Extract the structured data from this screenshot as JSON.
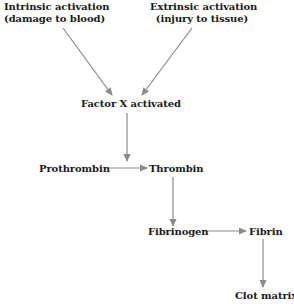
{
  "diagram": {
    "title": "",
    "nodes": {
      "intrinsic": {
        "line1": "Intrinsic activation",
        "line2": "(damage to blood)"
      },
      "extrinsic": {
        "line1": "Extrinsic activation",
        "line2": "(injury to tissue)"
      },
      "factor_x": {
        "label": "Factor X activated"
      },
      "prothrombin": {
        "label": "Prothrombin"
      },
      "thrombin": {
        "label": "Thrombin"
      },
      "fibrinogen": {
        "label": "Fibrinogen"
      },
      "fibrin": {
        "label": "Fibrin"
      },
      "clot_matrix": {
        "label": "Clot matrix"
      }
    },
    "edges": [
      {
        "from": "intrinsic",
        "to": "factor_x"
      },
      {
        "from": "extrinsic",
        "to": "factor_x"
      },
      {
        "from": "factor_x",
        "to": "thrombin"
      },
      {
        "from": "prothrombin",
        "to": "thrombin"
      },
      {
        "from": "thrombin",
        "to": "fibrinogen"
      },
      {
        "from": "fibrinogen",
        "to": "fibrin"
      },
      {
        "from": "fibrin",
        "to": "clot_matrix"
      }
    ],
    "colors": {
      "arrow": "#8a8a8a",
      "text": "#1a1a1a",
      "background": "#ffffff"
    }
  }
}
